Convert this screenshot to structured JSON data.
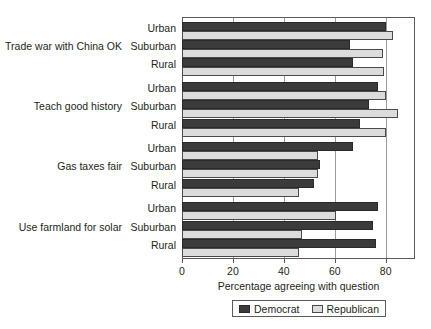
{
  "chart_data": {
    "type": "bar",
    "orientation": "horizontal",
    "title": "",
    "xlabel": "Percentage agreeing with question",
    "ylabel": "",
    "xlim": [
      0,
      91.5
    ],
    "xticks": [
      0,
      20,
      40,
      60,
      80
    ],
    "xtick_labels": [
      "0",
      "20",
      "40",
      "60",
      "80"
    ],
    "grid": "vertical",
    "legend_position": "bottom",
    "legend": [
      "Democrat",
      "Republican"
    ],
    "series": [
      {
        "name": "Democrat",
        "color": "#3b3b3b",
        "values": [
          80,
          66,
          67,
          77,
          73.5,
          70,
          67,
          54,
          52,
          77,
          75,
          76
        ]
      },
      {
        "name": "Republican",
        "color": "#dcdcdc",
        "values": [
          83,
          79,
          79.5,
          80,
          85,
          80,
          53.5,
          53.5,
          46,
          60.5,
          47,
          46
        ]
      }
    ],
    "groups": [
      {
        "label": "Trade war with China OK",
        "categories": [
          "Urban",
          "Suburban",
          "Rural"
        ],
        "Democrat": [
          80,
          66,
          67
        ],
        "Republican": [
          83,
          79,
          79.5
        ]
      },
      {
        "label": "Teach good history",
        "categories": [
          "Urban",
          "Suburban",
          "Rural"
        ],
        "Democrat": [
          77,
          73.5,
          70
        ],
        "Republican": [
          80,
          85,
          80
        ]
      },
      {
        "label": "Gas taxes fair",
        "categories": [
          "Urban",
          "Suburban",
          "Rural"
        ],
        "Democrat": [
          67,
          54,
          52
        ],
        "Republican": [
          53.5,
          53.5,
          46
        ]
      },
      {
        "label": "Use farmland for solar",
        "categories": [
          "Urban",
          "Suburban",
          "Rural"
        ],
        "Democrat": [
          77,
          75,
          76
        ],
        "Republican": [
          60.5,
          47,
          46
        ]
      }
    ]
  },
  "axis": {
    "x_title": "Percentage agreeing with question",
    "ticks": [
      "0",
      "20",
      "40",
      "60",
      "80"
    ]
  },
  "legend": {
    "democrat_label": "Democrat",
    "republican_label": "Republican"
  },
  "colors": {
    "democrat": "#3b3b3b",
    "republican": "#dcdcdc",
    "frame": "#5a5a5a",
    "grid": "#9a9a9a",
    "text": "#231f20"
  }
}
